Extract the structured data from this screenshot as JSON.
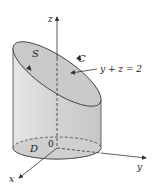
{
  "figure": {
    "labels": {
      "z_axis": "z",
      "x_axis": "x",
      "y_axis": "y",
      "surface": "S",
      "curve": "C",
      "plane_equation": "y + z = 2",
      "region": "D",
      "origin": "0"
    },
    "colors": {
      "cylinder_fill": "#d9d9d9",
      "top_fill": "#c8c8c8",
      "base_fill": "#cfcfcf",
      "line": "#333333"
    }
  }
}
